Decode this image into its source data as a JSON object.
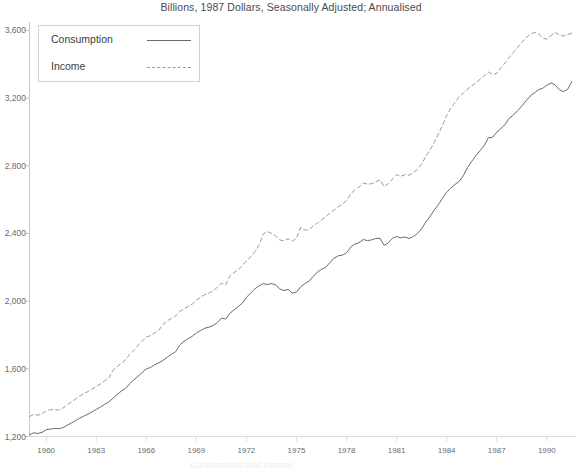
{
  "chart": {
    "title": "Billions, 1987 Dollars, Seasonally Adjusted; Annualised",
    "legend": {
      "items": [
        {
          "label": "Consumption",
          "style": "solid",
          "color": "#6a6a6a"
        },
        {
          "label": "Income",
          "style": "dashed",
          "color": "#9a9a9a"
        }
      ],
      "position": "top-left"
    },
    "footer_partial": "Consumption and Income"
  },
  "chart_data": {
    "type": "line",
    "title": "Billions, 1987 Dollars, Seasonally Adjusted; Annualised",
    "xlabel": "",
    "ylabel": "",
    "xlim": [
      1959.0,
      1991.75
    ],
    "ylim": [
      1200,
      3650
    ],
    "grid": false,
    "legend_position": "top-left",
    "ytick_labels": [
      "3,600",
      "3,200",
      "2,800",
      "2,400",
      "2,000",
      "1,600",
      "1,200"
    ],
    "ytick_values": [
      3600,
      3200,
      2800,
      2400,
      2000,
      1600,
      1200
    ],
    "xtick_labels": [
      "1960",
      "1963",
      "1966",
      "1969",
      "1972",
      "1975",
      "1978",
      "1981",
      "1984",
      "1987",
      "1990"
    ],
    "xtick_values": [
      1960,
      1963,
      1966,
      1969,
      1972,
      1975,
      1978,
      1981,
      1984,
      1987,
      1990
    ],
    "x": [
      1959.0,
      1959.25,
      1959.5,
      1959.75,
      1960.0,
      1960.25,
      1960.5,
      1960.75,
      1961.0,
      1961.25,
      1961.5,
      1961.75,
      1962.0,
      1962.25,
      1962.5,
      1962.75,
      1963.0,
      1963.25,
      1963.5,
      1963.75,
      1964.0,
      1964.25,
      1964.5,
      1964.75,
      1965.0,
      1965.25,
      1965.5,
      1965.75,
      1966.0,
      1966.25,
      1966.5,
      1966.75,
      1967.0,
      1967.25,
      1967.5,
      1967.75,
      1968.0,
      1968.25,
      1968.5,
      1968.75,
      1969.0,
      1969.25,
      1969.5,
      1969.75,
      1970.0,
      1970.25,
      1970.5,
      1970.75,
      1971.0,
      1971.25,
      1971.5,
      1971.75,
      1972.0,
      1972.25,
      1972.5,
      1972.75,
      1973.0,
      1973.25,
      1973.5,
      1973.75,
      1974.0,
      1974.25,
      1974.5,
      1974.75,
      1975.0,
      1975.25,
      1975.5,
      1975.75,
      1976.0,
      1976.25,
      1976.5,
      1976.75,
      1977.0,
      1977.25,
      1977.5,
      1977.75,
      1978.0,
      1978.25,
      1978.5,
      1978.75,
      1979.0,
      1979.25,
      1979.5,
      1979.75,
      1980.0,
      1980.25,
      1980.5,
      1980.75,
      1981.0,
      1981.25,
      1981.5,
      1981.75,
      1982.0,
      1982.25,
      1982.5,
      1982.75,
      1983.0,
      1983.25,
      1983.5,
      1983.75,
      1984.0,
      1984.25,
      1984.5,
      1984.75,
      1985.0,
      1985.25,
      1985.5,
      1985.75,
      1986.0,
      1986.25,
      1986.5,
      1986.75,
      1987.0,
      1987.25,
      1987.5,
      1987.75,
      1988.0,
      1988.25,
      1988.5,
      1988.75,
      1989.0,
      1989.25,
      1989.5,
      1989.75,
      1990.0,
      1990.25,
      1990.5,
      1990.75,
      1991.0,
      1991.25,
      1991.5
    ],
    "series": [
      {
        "name": "Consumption",
        "style": "solid",
        "color": "#6a6a6a",
        "values": [
          1210,
          1222,
          1218,
          1224,
          1240,
          1244,
          1248,
          1246,
          1252,
          1266,
          1280,
          1294,
          1308,
          1320,
          1332,
          1346,
          1360,
          1374,
          1390,
          1404,
          1426,
          1448,
          1468,
          1484,
          1512,
          1534,
          1556,
          1578,
          1600,
          1608,
          1624,
          1636,
          1650,
          1668,
          1686,
          1700,
          1740,
          1762,
          1778,
          1792,
          1812,
          1826,
          1840,
          1846,
          1856,
          1872,
          1900,
          1894,
          1928,
          1948,
          1968,
          1988,
          2022,
          2048,
          2072,
          2090,
          2104,
          2098,
          2104,
          2096,
          2072,
          2062,
          2070,
          2048,
          2054,
          2084,
          2104,
          2118,
          2146,
          2172,
          2188,
          2200,
          2228,
          2254,
          2268,
          2272,
          2286,
          2320,
          2338,
          2346,
          2364,
          2358,
          2362,
          2370,
          2372,
          2330,
          2344,
          2372,
          2382,
          2374,
          2380,
          2370,
          2382,
          2400,
          2428,
          2468,
          2500,
          2538,
          2570,
          2608,
          2644,
          2668,
          2690,
          2708,
          2742,
          2790,
          2826,
          2860,
          2890,
          2920,
          2966,
          2968,
          2998,
          3020,
          3044,
          3082,
          3100,
          3126,
          3152,
          3184,
          3212,
          3230,
          3250,
          3258,
          3276,
          3290,
          3278,
          3250,
          3238,
          3252,
          3298
        ]
      },
      {
        "name": "Income",
        "style": "dashed",
        "color": "#9a9a9a",
        "values": [
          1318,
          1330,
          1326,
          1334,
          1352,
          1358,
          1360,
          1356,
          1368,
          1386,
          1404,
          1420,
          1440,
          1452,
          1466,
          1480,
          1496,
          1510,
          1528,
          1546,
          1590,
          1612,
          1634,
          1652,
          1686,
          1708,
          1738,
          1762,
          1788,
          1796,
          1812,
          1828,
          1862,
          1884,
          1898,
          1912,
          1938,
          1954,
          1968,
          1982,
          2006,
          2022,
          2038,
          2048,
          2060,
          2082,
          2106,
          2096,
          2148,
          2168,
          2186,
          2210,
          2238,
          2262,
          2292,
          2330,
          2396,
          2412,
          2400,
          2386,
          2362,
          2356,
          2370,
          2354,
          2372,
          2436,
          2420,
          2422,
          2444,
          2462,
          2480,
          2498,
          2520,
          2538,
          2558,
          2572,
          2596,
          2632,
          2660,
          2674,
          2698,
          2692,
          2694,
          2704,
          2718,
          2678,
          2694,
          2722,
          2748,
          2738,
          2748,
          2744,
          2760,
          2780,
          2810,
          2856,
          2892,
          2938,
          2986,
          3040,
          3098,
          3140,
          3176,
          3208,
          3230,
          3254,
          3272,
          3290,
          3312,
          3332,
          3354,
          3340,
          3346,
          3380,
          3408,
          3440,
          3470,
          3500,
          3530,
          3556,
          3578,
          3588,
          3580,
          3556,
          3548,
          3570,
          3588,
          3574,
          3566,
          3576,
          3584
        ]
      }
    ]
  }
}
